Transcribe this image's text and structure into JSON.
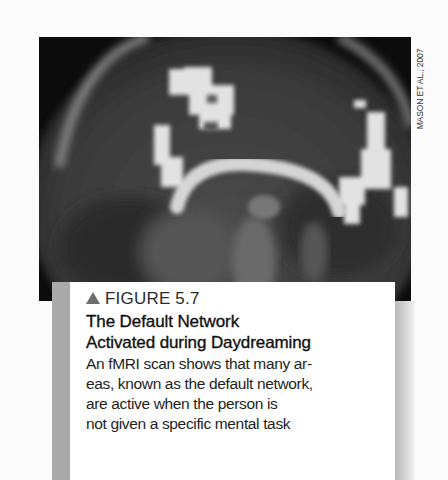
{
  "figure": {
    "credit": "MASON ET AL., 2007",
    "label": "FIGURE 5.7",
    "title_lines": [
      "The Default Network",
      "Activated during Daydreaming"
    ],
    "body_lines": [
      "An fMRI scan shows that many ar-",
      "eas, known as the default network,",
      "are active when the person is",
      "not given a specific mental task"
    ],
    "icon": "triangle-up-icon",
    "image": "fMRI sagittal brain scan with highlighted (white) default-network activation areas",
    "colors": {
      "label_triangle": "#6e6e6e",
      "caption_bg": "#ffffff",
      "side_bar": "#a9a9a9",
      "scan_bg": "#0c0c0c"
    }
  }
}
